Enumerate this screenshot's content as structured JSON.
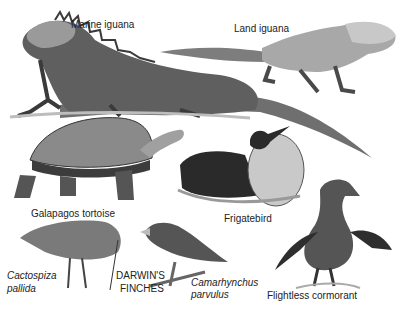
{
  "labels": {
    "marine_iguana": "Marine iguana",
    "land_iguana": "Land iguana",
    "galapagos_tortoise": "Galapagos tortoise",
    "frigatebird": "Frigatebird",
    "cactospiza_1": "Cactospiza",
    "cactospiza_2": "pallida",
    "darwins_1": "DARWIN'S",
    "darwins_2": "FINCHES",
    "camarhynchus_1": "Camarhynchus",
    "camarhynchus_2": "parvulus",
    "flightless_cormorant": "Flightless cormorant"
  },
  "colors": {
    "ink": "#222222",
    "dark": "#3a3a3a",
    "mid": "#7a7a7a",
    "light": "#b5b5b5",
    "pale": "#d8d8d8"
  }
}
